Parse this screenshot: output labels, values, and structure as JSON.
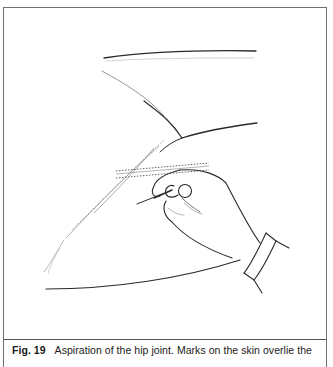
{
  "figure": {
    "label": "Fig. 19",
    "caption_text": "Aspiration of the hip joint. Marks on the skin overlie the",
    "illustration_subject": "hand-inserting-needle-into-hip",
    "colors": {
      "frame": "#6f6f6f",
      "ink": "#2a2a2a",
      "faint_ink": "#9a9a9a",
      "background": "#ffffff"
    }
  }
}
